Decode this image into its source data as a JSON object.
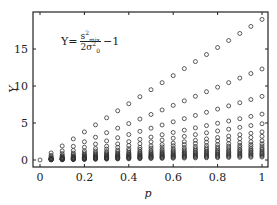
{
  "chart_data": {
    "type": "scatter",
    "title": "",
    "annotation": {
      "lhs": "Y",
      "equals": "=",
      "numerator": "s",
      "numerator_sup": "2",
      "numerator_sub": "mix",
      "denominator": "2σ",
      "denominator_sup": "2",
      "denominator_sub": "0",
      "tail": "−1",
      "full_text": "Y = s²_mix / (2σ₀²) − 1"
    },
    "xlabel": "p",
    "ylabel": "Y",
    "xlim": [
      -0.03,
      1.03
    ],
    "ylim": [
      -1,
      20
    ],
    "xticks": [
      0,
      0.2,
      0.4,
      0.6,
      0.8,
      1
    ],
    "xtick_labels": [
      "0",
      "0.2",
      "0.4",
      "0.6",
      "0.8",
      "1"
    ],
    "yticks": [
      0,
      5,
      10,
      15
    ],
    "ytick_labels": [
      "0",
      "5",
      "10",
      "15"
    ],
    "grid": false,
    "legend": null,
    "marker": "open-circle",
    "x": [
      0,
      0.05,
      0.1,
      0.15,
      0.2,
      0.25,
      0.3,
      0.35,
      0.4,
      0.45,
      0.5,
      0.55,
      0.6,
      0.65,
      0.7,
      0.75,
      0.8,
      0.85,
      0.9,
      0.95,
      1.0
    ],
    "series_slopes_note": "Each series approximately linear Y = k·p",
    "series": [
      {
        "name": "s1",
        "slope": 19.0
      },
      {
        "name": "s2",
        "slope": 12.3
      },
      {
        "name": "s3",
        "slope": 8.6
      },
      {
        "name": "s4",
        "slope": 6.2
      },
      {
        "name": "s5",
        "slope": 4.9
      },
      {
        "name": "s6",
        "slope": 3.8
      },
      {
        "name": "s7",
        "slope": 3.2
      },
      {
        "name": "s8",
        "slope": 2.6
      },
      {
        "name": "s9",
        "slope": 2.2
      },
      {
        "name": "s10",
        "slope": 1.9
      },
      {
        "name": "s11",
        "slope": 1.6
      },
      {
        "name": "s12",
        "slope": 1.4
      },
      {
        "name": "s13",
        "slope": 1.2
      },
      {
        "name": "s14",
        "slope": 1.0
      },
      {
        "name": "s15",
        "slope": 0.85
      },
      {
        "name": "s16",
        "slope": 0.7
      },
      {
        "name": "s17",
        "slope": 0.55
      },
      {
        "name": "s18",
        "slope": 0.4
      }
    ]
  }
}
